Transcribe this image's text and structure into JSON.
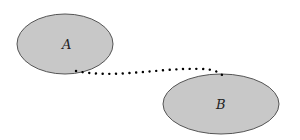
{
  "diagram": {
    "nodes": [
      {
        "id": "A",
        "label": "A",
        "cx": 65,
        "cy": 44,
        "rx": 48,
        "ry": 30,
        "fill": "#c8c8c8",
        "stroke": "#555555"
      },
      {
        "id": "B",
        "label": "B",
        "cx": 221,
        "cy": 104,
        "rx": 58,
        "ry": 30,
        "fill": "#c8c8c8",
        "stroke": "#555555"
      }
    ],
    "edges": [
      {
        "from": "A",
        "to": "B",
        "style": "dotted",
        "color": "#000000"
      }
    ]
  }
}
